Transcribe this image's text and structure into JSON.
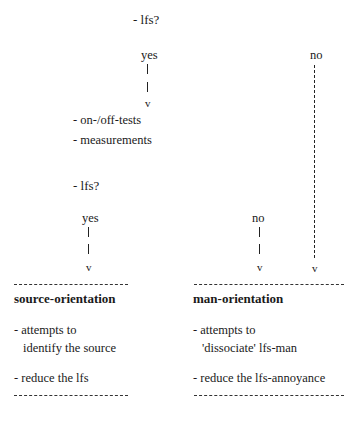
{
  "diagram": {
    "top_question": "- lfs?",
    "branch_yes_label": "yes",
    "branch_no_label": "no",
    "arrow_glyph": "v",
    "steps": [
      "- on-/off-tests",
      "- measurements"
    ],
    "second_question": "- lfs?",
    "second_yes_label": "yes",
    "second_no_label": "no"
  },
  "outcomes": {
    "source": {
      "title": "source-orientation",
      "items": [
        {
          "line1": "- attempts to",
          "line2": "identify the source"
        },
        {
          "line1": "- reduce the lfs"
        }
      ]
    },
    "man": {
      "title": "man-orientation",
      "items": [
        {
          "line1": "- attempts to",
          "line2": "'dissociate' lfs-man"
        },
        {
          "line1": "- reduce the lfs-annoyance"
        }
      ]
    }
  }
}
